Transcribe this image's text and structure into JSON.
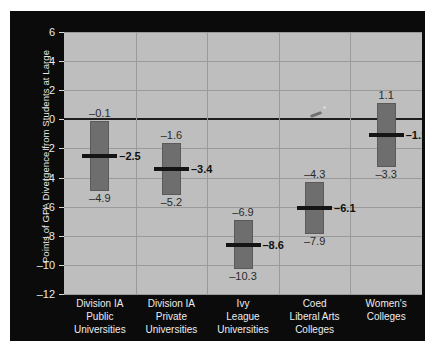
{
  "chart_data": {
    "type": "bar",
    "title": "",
    "xlabel": "",
    "ylabel": "Points of GPA Divergence from Students at Large",
    "ylim": [
      -12,
      6
    ],
    "yticks": [
      6,
      4,
      2,
      0,
      -2,
      -4,
      -6,
      -8,
      -10,
      -12
    ],
    "ytick_labels": [
      "6",
      "4",
      "2",
      "0",
      "–2",
      "–4",
      "–6",
      "–8",
      "–10",
      "–12"
    ],
    "grid": true,
    "legend": "none",
    "zero_reference_line": 0,
    "categories": [
      "Division IA Public Universities",
      "Division IA Private Universities",
      "Ivy League Universities",
      "Coed Liberal Arts Colleges",
      "Women's Colleges"
    ],
    "category_lines": [
      [
        "Division IA",
        "Public",
        "Universities"
      ],
      [
        "Division IA",
        "Private",
        "Universities"
      ],
      [
        "Ivy",
        "League",
        "Universities"
      ],
      [
        "Coed",
        "Liberal Arts",
        "Colleges"
      ],
      [
        "Women's",
        "Colleges"
      ]
    ],
    "series": [
      {
        "name": "GPA divergence range",
        "points": [
          {
            "category": "Division IA Public Universities",
            "high": -0.1,
            "median": -2.5,
            "low": -4.9,
            "high_label": "–0.1",
            "median_label": "–2.5",
            "low_label": "–4.9"
          },
          {
            "category": "Division IA Private Universities",
            "high": -1.6,
            "median": -3.4,
            "low": -5.2,
            "high_label": "–1.6",
            "median_label": "–3.4",
            "low_label": "–5.2"
          },
          {
            "category": "Ivy League Universities",
            "high": -6.9,
            "median": -8.6,
            "low": -10.3,
            "high_label": "–6.9",
            "median_label": "–8.6",
            "low_label": "–10.3"
          },
          {
            "category": "Coed Liberal Arts Colleges",
            "high": -4.3,
            "median": -6.1,
            "low": -7.9,
            "high_label": "–4.3",
            "median_label": "–6.1",
            "low_label": "–7.9"
          },
          {
            "category": "Women's Colleges",
            "high": 1.1,
            "median": -1.1,
            "low": -3.3,
            "high_label": "1.1",
            "median_label": "–1.1",
            "low_label": "–3.3"
          }
        ]
      }
    ],
    "colors": {
      "panel_background": "#0b0b0b",
      "plot_background": "#bebebe",
      "bar_fill": "#6e6e6e",
      "median_line": "#141414",
      "grid_line": "#9a9a9a",
      "axis_text": "#eaeaea",
      "value_text": "#2a2a2a"
    }
  }
}
